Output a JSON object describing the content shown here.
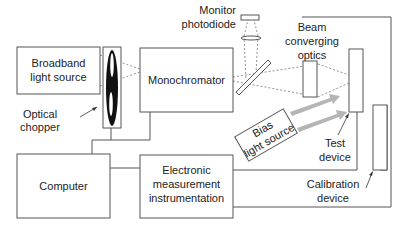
{
  "diagram": {
    "components": {
      "broadband": {
        "line1": "Broadband",
        "line2": "light source"
      },
      "chopper": {
        "line1": "Optical",
        "line2": "chopper"
      },
      "monochromator": {
        "label": "Monochromator"
      },
      "photodiode": {
        "line1": "Monitor",
        "line2": "photodiode"
      },
      "beam_optics": {
        "line1": "Beam",
        "line2": "converging",
        "line3": "optics"
      },
      "bias": {
        "line1": "Bias",
        "line2": "light source"
      },
      "test_device": {
        "line1": "Test",
        "line2": "device"
      },
      "calibration": {
        "line1": "Calibration",
        "line2": "device"
      },
      "computer": {
        "label": "Computer"
      },
      "electronics": {
        "line1": "Electronic",
        "line2": "measurement",
        "line3": "instrumentation"
      }
    },
    "colors": {
      "line": "#555555",
      "beam": "#777777",
      "bias_arrow": "#b5b5b5",
      "chopper": "#111111"
    }
  }
}
